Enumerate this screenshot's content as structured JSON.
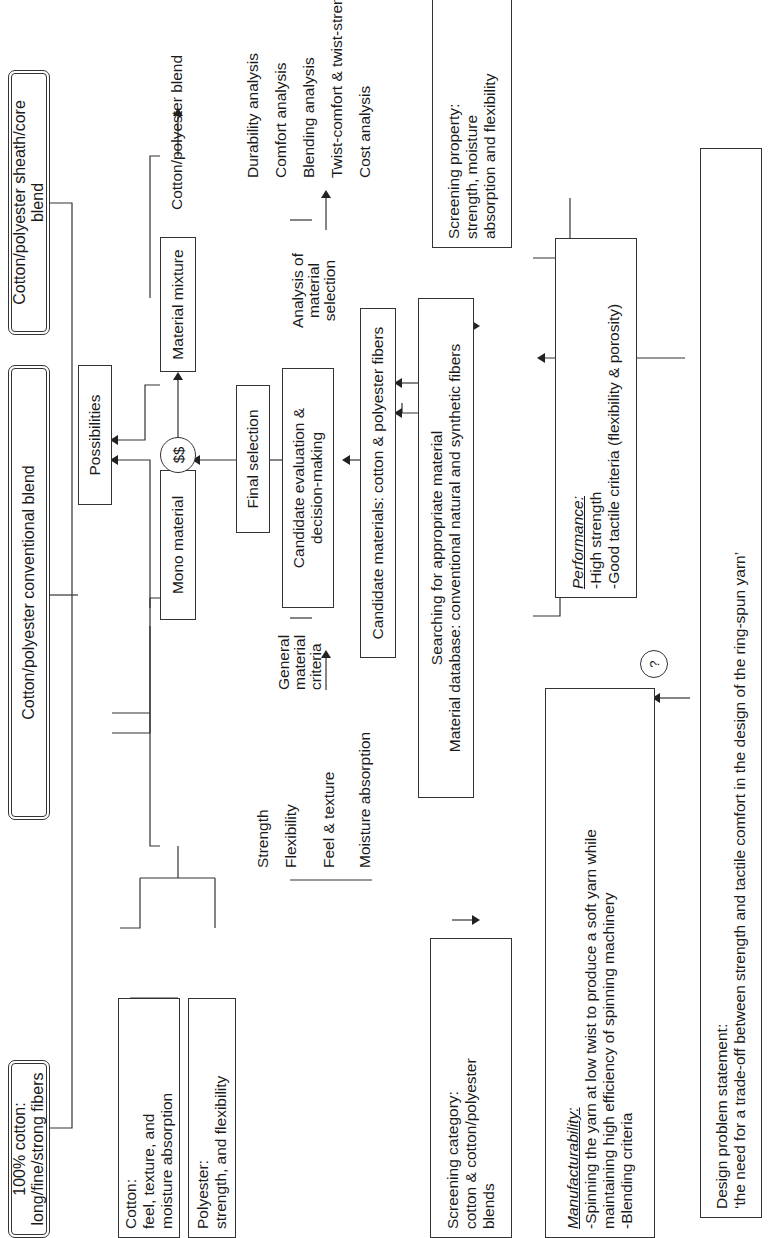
{
  "diagram": {
    "orientation": "rotated 90 degrees counter-clockwise",
    "outcomes": [
      {
        "id": "cotton_100",
        "label": "100% cotton: long/fine/strong fibers"
      },
      {
        "id": "conventional_blend",
        "label": "Cotton/polyester conventional blend"
      },
      {
        "id": "sheath_core_blend",
        "label": "Cotton/polyester sheath/core blend"
      }
    ],
    "possibilities": {
      "label": "Possibilities"
    },
    "cost_node": {
      "label": "$$"
    },
    "mono_material": {
      "label": "Mono material"
    },
    "material_mixture": {
      "label": "Material mixture"
    },
    "mixture_result": {
      "label": "Cotton/polyester blend"
    },
    "cotton_props": {
      "title": "Cotton:",
      "lines": [
        "feel, texture, and",
        "moisture absorption"
      ]
    },
    "polyester_props": {
      "title": "Polyester:",
      "lines": [
        "strength, and flexibility"
      ]
    },
    "final_selection": {
      "label": "Final selection"
    },
    "candidate_evaluation": {
      "lines": [
        "Candidate evaluation &",
        "decision-making"
      ]
    },
    "general_criteria": {
      "lines": [
        "General",
        "material",
        "criteria"
      ],
      "items": [
        "Strength",
        "Flexibility",
        "Feel & texture",
        "Moisture absorption"
      ]
    },
    "analysis": {
      "lines": [
        "Analysis of",
        "material",
        "selection"
      ],
      "items": [
        "Durability analysis",
        "Comfort analysis",
        "Blending analysis",
        "Twist-comfort & twist-strength",
        "Cost analysis"
      ]
    },
    "candidate_materials": {
      "label": "Candidate materials: cotton & polyester fibers"
    },
    "searching": {
      "lines": [
        "Searching for appropriate material",
        "Material database: conventional natural and synthetic fibers"
      ]
    },
    "screening_category": {
      "lines": [
        "Screening category:",
        "cotton & cotton/polyester",
        "blends"
      ]
    },
    "screening_property": {
      "lines": [
        "Screening property:",
        "strength, moisture",
        "absorption and flexibility"
      ]
    },
    "manufacturability": {
      "title": "Manufacturability:",
      "lines": [
        "-Spinning the yarn at low twist to produce a soft yarn while",
        "maintaining high efficiency of spinning machinery",
        "-Blending criteria"
      ]
    },
    "decision_node": {
      "label": "?"
    },
    "performance": {
      "title": "Performance:",
      "lines": [
        "-High strength",
        "-Good tactile criteria (flexibility & porosity)"
      ]
    },
    "problem_statement": {
      "lines": [
        "Design problem statement:",
        "‘the need for a trade-off between strength and tactile comfort in the design of the ring-spun yarn’"
      ]
    }
  }
}
